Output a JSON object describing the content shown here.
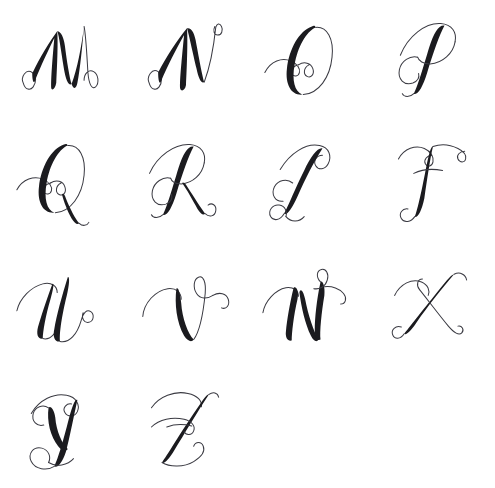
{
  "sheet": {
    "title": "Calligraphy Script Alphabet Specimen",
    "background_color": "#ffffff",
    "ink_color": "#1b1b1f",
    "hairline_color": "#3a3a42",
    "width": 495,
    "height": 488,
    "columns": 4,
    "rows": 4,
    "script_style": "copperplate-spencerian-script",
    "letter_case": "uppercase"
  },
  "rows": [
    {
      "index": 0,
      "cells": [
        {
          "letter": "M",
          "name": "glyph-letter-m",
          "empty": false
        },
        {
          "letter": "N",
          "name": "glyph-letter-n",
          "empty": false
        },
        {
          "letter": "O",
          "name": "glyph-letter-o",
          "empty": false
        },
        {
          "letter": "P",
          "name": "glyph-letter-p",
          "empty": false
        }
      ]
    },
    {
      "index": 1,
      "cells": [
        {
          "letter": "Q",
          "name": "glyph-letter-q",
          "empty": false
        },
        {
          "letter": "R",
          "name": "glyph-letter-r",
          "empty": false
        },
        {
          "letter": "S",
          "name": "glyph-letter-s",
          "empty": false
        },
        {
          "letter": "T",
          "name": "glyph-letter-t",
          "empty": false
        }
      ]
    },
    {
      "index": 2,
      "cells": [
        {
          "letter": "U",
          "name": "glyph-letter-u",
          "empty": false
        },
        {
          "letter": "V",
          "name": "glyph-letter-v",
          "empty": false
        },
        {
          "letter": "W",
          "name": "glyph-letter-w",
          "empty": false
        },
        {
          "letter": "X",
          "name": "glyph-letter-x",
          "empty": false
        }
      ]
    },
    {
      "index": 3,
      "cells": [
        {
          "letter": "Y",
          "name": "glyph-letter-y",
          "empty": false
        },
        {
          "letter": "Z",
          "name": "glyph-letter-z",
          "empty": false
        },
        {
          "letter": "",
          "name": "glyph-cell-empty-1",
          "empty": true
        },
        {
          "letter": "",
          "name": "glyph-cell-empty-2",
          "empty": true
        }
      ]
    }
  ],
  "letters_in_order": [
    "M",
    "N",
    "O",
    "P",
    "Q",
    "R",
    "S",
    "T",
    "U",
    "V",
    "W",
    "X",
    "Y",
    "Z"
  ]
}
